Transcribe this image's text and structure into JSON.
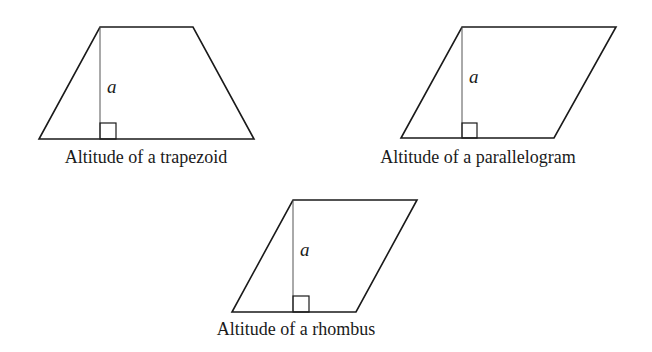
{
  "figures": [
    {
      "id": "trapezoid",
      "caption": "Altitude of a trapezoid",
      "altitude_label": "a",
      "points": "100,27 193,27 254,139 39,139",
      "altitude": {
        "x": 100,
        "y1": 27,
        "y2": 139
      },
      "right_angle_box": {
        "x": 100,
        "y": 123,
        "size": 16
      },
      "label_pos": {
        "x": 107,
        "y": 93
      },
      "caption_pos": {
        "x": 146,
        "y": 163
      }
    },
    {
      "id": "parallelogram",
      "caption": "Altitude of a parallelogram",
      "altitude_label": "a",
      "points": "462,27 616,27 554,138 401,138",
      "altitude": {
        "x": 462,
        "y1": 27,
        "y2": 138
      },
      "right_angle_box": {
        "x": 462,
        "y": 123,
        "size": 15
      },
      "label_pos": {
        "x": 469,
        "y": 83
      },
      "caption_pos": {
        "x": 478,
        "y": 163
      }
    },
    {
      "id": "rhombus",
      "caption": "Altitude of a rhombus",
      "altitude_label": "a",
      "points": "293,200 417,200 356,312 232,312",
      "altitude": {
        "x": 293,
        "y1": 200,
        "y2": 312
      },
      "right_angle_box": {
        "x": 293,
        "y": 296,
        "size": 16
      },
      "label_pos": {
        "x": 300,
        "y": 256
      },
      "caption_pos": {
        "x": 296,
        "y": 335
      }
    }
  ]
}
